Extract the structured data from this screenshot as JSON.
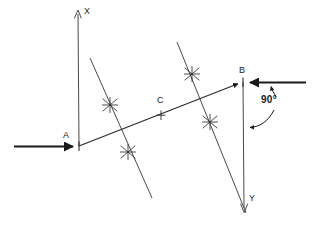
{
  "figure": {
    "background_color": "#ffffff",
    "stroke_color": "#3a3a3a",
    "heavy_stroke_color": "#1a1a1a",
    "width": 317,
    "height": 226,
    "labels": {
      "point_a": "A",
      "point_b": "B",
      "point_c": "C",
      "ray_x": "X",
      "ray_y": "Y",
      "angle": "90°"
    },
    "points": {
      "a": {
        "x": 79,
        "y": 146
      },
      "b": {
        "x": 243,
        "y": 82
      },
      "c": {
        "x": 161,
        "y": 115
      },
      "x_tip": {
        "x": 78,
        "y": 10
      },
      "y_tip": {
        "x": 244,
        "y": 212
      }
    },
    "label_positions": {
      "point_a": {
        "x": 64,
        "y": 132
      },
      "point_b": {
        "x": 240,
        "y": 68
      },
      "point_c": {
        "x": 157,
        "y": 98
      },
      "ray_x": {
        "x": 84,
        "y": 8
      },
      "ray_y": {
        "x": 248,
        "y": 195
      },
      "angle": {
        "x": 261,
        "y": 94
      }
    },
    "arc_marks": [
      {
        "name": "arc-mark-left-upper",
        "x": 110,
        "y": 105
      },
      {
        "name": "arc-mark-left-lower",
        "x": 128,
        "y": 152
      },
      {
        "name": "arc-mark-right-upper",
        "x": 192,
        "y": 74
      },
      {
        "name": "arc-mark-right-lower",
        "x": 210,
        "y": 122
      }
    ],
    "construction_lines": [
      {
        "name": "left-perpendicular-bisector",
        "x1": 90,
        "y1": 58,
        "x2": 152,
        "y2": 198
      },
      {
        "name": "right-perpendicular-bisector",
        "x1": 177,
        "y1": 42,
        "x2": 246,
        "y2": 213
      }
    ],
    "rays": [
      {
        "name": "ray-AX-vertical",
        "x1": 78,
        "y1": 10,
        "x2": 79,
        "y2": 146
      },
      {
        "name": "ray-BY-vertical",
        "x1": 243,
        "y1": 82,
        "x2": 244,
        "y2": 211
      },
      {
        "name": "ray-left-horizontal-to-A",
        "x1": 14,
        "y1": 146,
        "x2": 79,
        "y2": 146
      },
      {
        "name": "ray-B-horizontal-right",
        "x1": 243,
        "y1": 82,
        "x2": 306,
        "y2": 82
      },
      {
        "name": "segment-AB",
        "x1": 79,
        "y1": 146,
        "x2": 243,
        "y2": 82
      }
    ]
  }
}
